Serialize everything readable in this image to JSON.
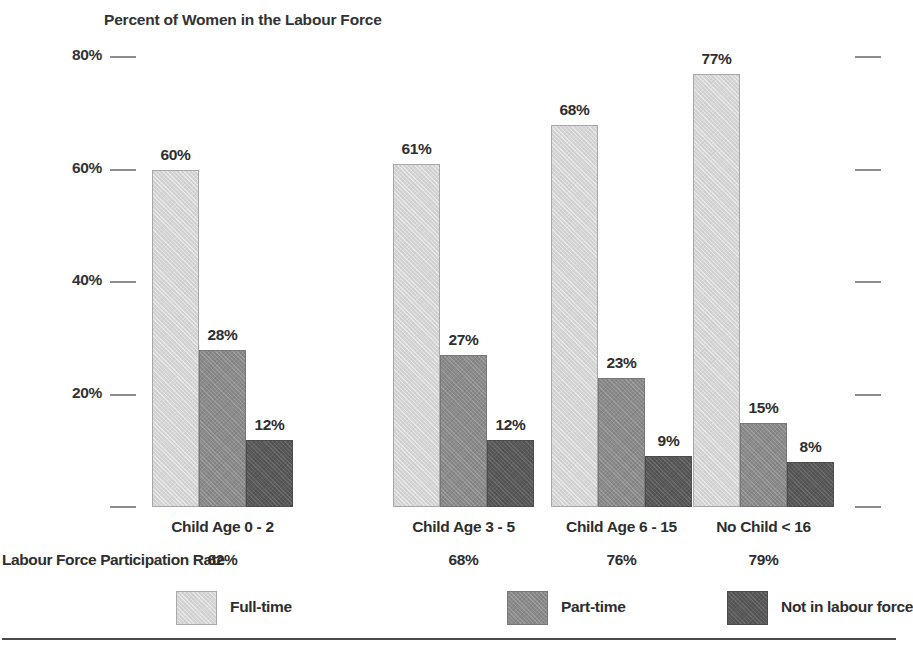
{
  "chart_data": {
    "type": "bar",
    "title": "Percent of Women in the Labour Force",
    "xlabel": "",
    "ylabel": "",
    "ylim": [
      0,
      80
    ],
    "yticks": [
      {
        "value": 80,
        "label": "80%"
      },
      {
        "value": 60,
        "label": "60%"
      },
      {
        "value": 40,
        "label": "40%"
      },
      {
        "value": 20,
        "label": "20%"
      },
      {
        "value": 0,
        "label": ""
      }
    ],
    "grid": false,
    "legend_position": "bottom",
    "categories": [
      "Child Age 0 - 2",
      "Child Age 3 - 5",
      "Child Age 6 - 15",
      "No Child < 16"
    ],
    "series": [
      {
        "name": "Full-time",
        "color": "#d4d4d4",
        "values": [
          60,
          61,
          68,
          77
        ],
        "labels": [
          "60%",
          "61%",
          "68%",
          "77%"
        ]
      },
      {
        "name": "Part-time",
        "color": "#8a8a8a",
        "values": [
          28,
          27,
          23,
          15
        ],
        "labels": [
          "28%",
          "27%",
          "23%",
          "15%"
        ]
      },
      {
        "name": "Not in labour force",
        "color": "#585858",
        "values": [
          12,
          12,
          9,
          8
        ],
        "labels": [
          "12%",
          "12%",
          "9%",
          "8%"
        ]
      }
    ],
    "annotations": {
      "participation_rate_label": "Labour Force Participation Rate",
      "participation_rates": [
        "62%",
        "68%",
        "76%",
        "79%"
      ]
    }
  },
  "legend": {
    "items": [
      {
        "label": "Full-time",
        "color": "#d4d4d4"
      },
      {
        "label": "Part-time",
        "color": "#8a8a8a"
      },
      {
        "label": "Not in labour force",
        "color": "#585858"
      }
    ]
  },
  "footer": {
    "source_note": ""
  }
}
